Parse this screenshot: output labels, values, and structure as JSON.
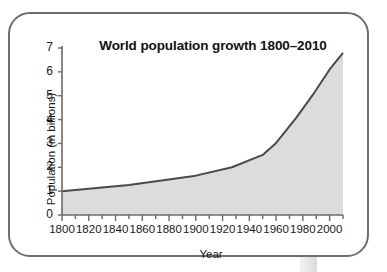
{
  "figure": {
    "background_color": "#ffffff",
    "card_border_color": "#6e6e6e",
    "stem_color": "#e4e4e4"
  },
  "chart_data": {
    "type": "area",
    "title": "World population growth 1800–2010",
    "xlabel": "Year",
    "ylabel": "Population (in billions)",
    "xlim": [
      1800,
      2010
    ],
    "ylim": [
      0,
      7
    ],
    "grid": false,
    "legend": "none",
    "line_color": "#4a4a4a",
    "fill_color": "#dcdcdc",
    "axis_color": "#6a6a6a",
    "x_major_ticks": [
      1800,
      1820,
      1840,
      1860,
      1880,
      1900,
      1920,
      1940,
      1960,
      1980,
      2000
    ],
    "x_minor_tick_step": 10,
    "x_tick_labels": [
      "1800",
      "1820",
      "1840",
      "1860",
      "1880",
      "1900",
      "1920",
      "1940",
      "1960",
      "1980",
      "2000"
    ],
    "y_ticks": [
      0,
      1,
      2,
      3,
      4,
      5,
      6,
      7
    ],
    "y_tick_labels": [
      "0",
      "1",
      "2",
      "3",
      "4",
      "5",
      "6",
      "7"
    ],
    "x": [
      1800,
      1850,
      1900,
      1927,
      1950,
      1960,
      1975,
      1987,
      2000,
      2010
    ],
    "values": [
      1.0,
      1.26,
      1.65,
      2.0,
      2.52,
      3.02,
      4.07,
      5.0,
      6.1,
      6.8
    ],
    "series": [
      {
        "name": "World population",
        "x": [
          1800,
          1850,
          1900,
          1927,
          1950,
          1960,
          1975,
          1987,
          2000,
          2010
        ],
        "values": [
          1.0,
          1.26,
          1.65,
          2.0,
          2.52,
          3.02,
          4.07,
          5.0,
          6.1,
          6.8
        ]
      }
    ]
  }
}
